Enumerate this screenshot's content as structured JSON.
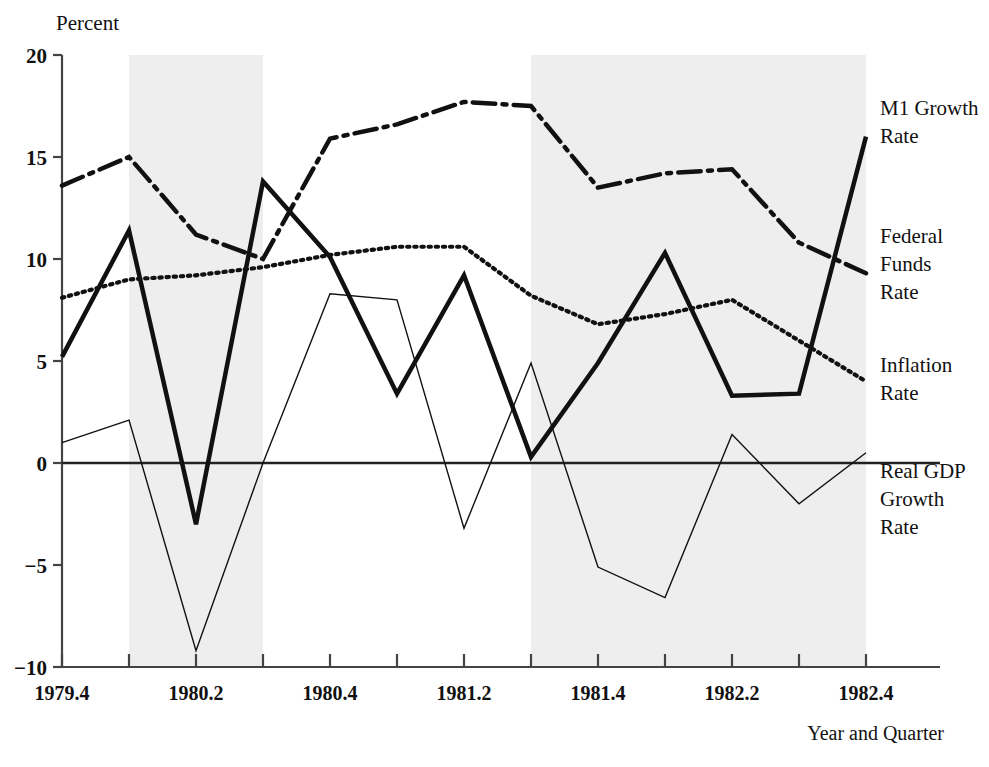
{
  "chart_data": {
    "type": "line",
    "title": "",
    "ylabel": "Percent",
    "xlabel": "Year and Quarter",
    "ylim": [
      -10,
      20
    ],
    "yticks": [
      20,
      15,
      10,
      5,
      0,
      -5,
      -10
    ],
    "ytick_labels": [
      "20",
      "15",
      "10",
      "5",
      "0",
      "−5",
      "−10"
    ],
    "grid": false,
    "legend_position": "right-inline",
    "x": [
      "1979.4",
      "1980.1",
      "1980.2",
      "1980.3",
      "1980.4",
      "1981.1",
      "1981.2",
      "1981.3",
      "1981.4",
      "1982.1",
      "1982.2",
      "1982.3",
      "1982.4"
    ],
    "xtick_labels": [
      "1979.4",
      "",
      "1980.2",
      "",
      "1980.4",
      "",
      "1981.2",
      "",
      "1981.4",
      "",
      "1982.2",
      "",
      "1982.4"
    ],
    "categories": [
      "1979.4",
      "1980.1",
      "1980.2",
      "1980.3",
      "1980.4",
      "1981.1",
      "1981.2",
      "1981.3",
      "1981.4",
      "1982.1",
      "1982.2",
      "1982.3",
      "1982.4"
    ],
    "series": [
      {
        "name": "M1 Growth Rate",
        "style": "dash-dot",
        "width": 4.5,
        "color": "#111111",
        "label_lines": [
          "M1 Growth",
          "Rate"
        ],
        "values": [
          13.6,
          15.0,
          11.2,
          10.0,
          15.9,
          16.6,
          17.7,
          17.5,
          13.5,
          14.2,
          14.4,
          10.8,
          9.3
        ]
      },
      {
        "name": "Federal Funds Rate",
        "style": "solid",
        "width": 4.5,
        "color": "#111111",
        "label_lines": [
          "Federal",
          "Funds",
          "Rate"
        ],
        "values": [
          5.2,
          11.4,
          -3.0,
          13.8,
          10.1,
          3.4,
          9.2,
          0.3,
          4.9,
          10.3,
          3.3,
          3.4,
          16.0
        ]
      },
      {
        "name": "Inflation Rate",
        "style": "dotted",
        "width": 4.2,
        "color": "#111111",
        "label_lines": [
          "Inflation",
          "Rate"
        ],
        "values": [
          8.1,
          9.0,
          9.2,
          9.6,
          10.2,
          10.6,
          10.6,
          8.2,
          6.8,
          7.3,
          8.0,
          6.0,
          4.0
        ]
      },
      {
        "name": "Real GDP Growth Rate",
        "style": "solid",
        "width": 1.4,
        "color": "#111111",
        "label_lines": [
          "Real GDP",
          "Growth",
          "Rate"
        ],
        "values": [
          1.0,
          2.1,
          -9.2,
          0.0,
          8.3,
          8.0,
          -3.2,
          4.9,
          -5.1,
          -6.6,
          1.4,
          -2.0,
          0.5
        ]
      }
    ],
    "annotations": [
      {
        "name": "recession-band-1",
        "from": "1980.1",
        "to": "1980.3",
        "fill": "#eeeeee"
      },
      {
        "name": "recession-band-2",
        "from": "1981.3",
        "to": "1982.4",
        "fill": "#eeeeee"
      }
    ],
    "zero_line": 0
  }
}
